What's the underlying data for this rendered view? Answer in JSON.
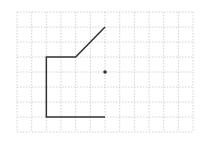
{
  "diagram": {
    "grid": {
      "x0": 17,
      "y0": 12,
      "cols": 12,
      "rows": 8,
      "cell_w": 14.67,
      "cell_h": 15,
      "line_color": "#c8c8c8",
      "dash": "1.5,1.5"
    },
    "path": {
      "points": [
        [
          6,
          1
        ],
        [
          4,
          3
        ],
        [
          2,
          3
        ],
        [
          2,
          7
        ],
        [
          6,
          7
        ]
      ],
      "stroke": "#333333",
      "width": 1.5
    },
    "dot": {
      "col": 6,
      "row": 4,
      "r": 1.8,
      "fill": "#333333"
    }
  }
}
